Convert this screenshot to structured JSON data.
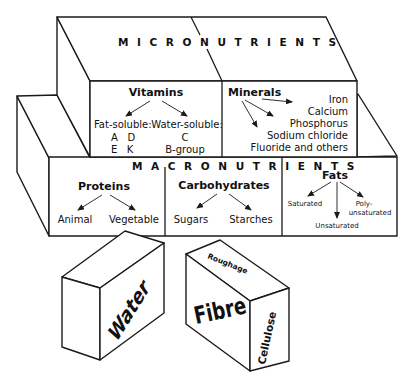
{
  "diagram": {
    "colors": {
      "stroke": "#1a1a1a",
      "fill": "#ffffff",
      "text": "#111111"
    },
    "micronutrients": {
      "label": "MICRONUTRIENTS",
      "vitamins": {
        "title": "Vitamins",
        "fat_soluble": {
          "label": "Fat-soluble:",
          "row1": "A   D",
          "row2": "E   K"
        },
        "water_soluble": {
          "label": "Water-soluble:",
          "row1": "C",
          "row2": "B-group"
        }
      },
      "minerals": {
        "title": "Minerals",
        "items": [
          "Iron",
          "Calcium",
          "Phosphorus",
          "Sodium chloride",
          "Fluoride and others"
        ]
      }
    },
    "macronutrients": {
      "label": "MACRONUTRIENTS",
      "proteins": {
        "title": "Proteins",
        "items": [
          "Animal",
          "Vegetable"
        ]
      },
      "carbohydrates": {
        "title": "Carbohydrates",
        "items": [
          "Sugars",
          "Starches"
        ]
      },
      "fats": {
        "title": "Fats",
        "saturated": "Saturated",
        "unsaturated": "Unsaturated",
        "poly_line1": "Poly-",
        "poly_line2": "unsaturated"
      }
    },
    "water_block": {
      "label": "Water"
    },
    "fibre_block": {
      "front": "Fibre",
      "top": "Roughage",
      "side": "Cellulose"
    }
  }
}
